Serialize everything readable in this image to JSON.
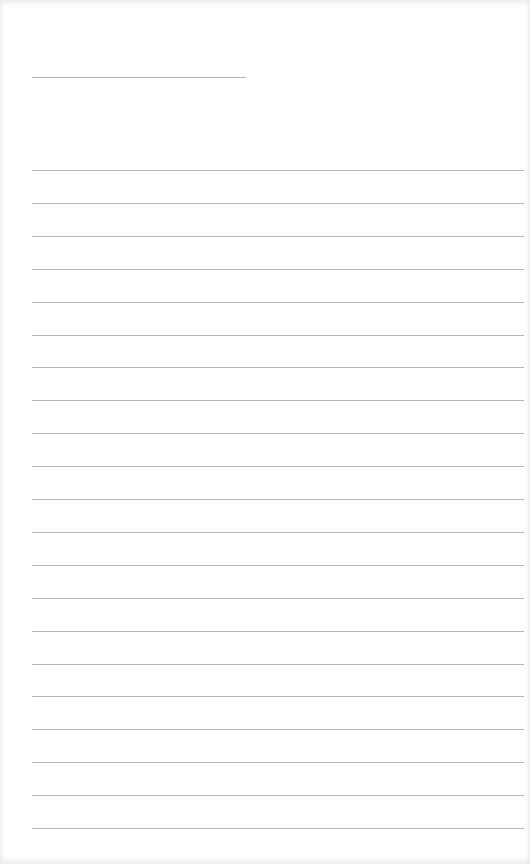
{
  "page": {
    "type": "blank lined notepaper",
    "title_line": {
      "x": 32,
      "y": 77,
      "width": 214,
      "color": "#b4b4b4"
    },
    "ruled_lines": {
      "count": 21,
      "first_y": 170,
      "spacing": 32.9,
      "x": 32,
      "width": 492,
      "color": "#b8b8b8"
    }
  }
}
